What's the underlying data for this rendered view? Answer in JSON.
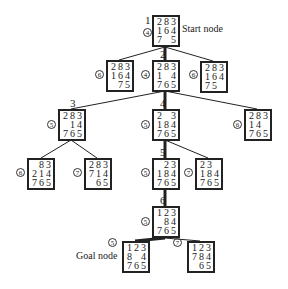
{
  "diagram": {
    "title": "",
    "labels": {
      "start": "Start node",
      "goal": "Goal node"
    },
    "nodes": [
      {
        "id": "n1",
        "order": "1",
        "cost": "4",
        "tiles": [
          "2",
          "8",
          "3",
          "1",
          "6",
          "4",
          "7",
          " ",
          "5"
        ],
        "x": 152,
        "y": 15,
        "cost_pos": [
          143,
          28
        ],
        "order_pos": [
          145,
          15
        ]
      },
      {
        "id": "n2a",
        "order": "",
        "cost": "6",
        "tiles": [
          "2",
          "8",
          "3",
          "1",
          "6",
          "4",
          " ",
          "7",
          "5"
        ],
        "x": 106,
        "y": 60,
        "cost_pos": [
          95,
          70
        ]
      },
      {
        "id": "n2",
        "order": "2",
        "cost": "4",
        "tiles": [
          "2",
          "8",
          "3",
          "1",
          " ",
          "4",
          "7",
          "6",
          "5"
        ],
        "x": 152,
        "y": 60,
        "cost_pos": [
          141,
          70
        ],
        "order_pos": [
          160,
          49
        ]
      },
      {
        "id": "n2c",
        "order": "",
        "cost": "6",
        "tiles": [
          "2",
          "8",
          "3",
          "1",
          "6",
          "4",
          "7",
          "5",
          " "
        ],
        "x": 200,
        "y": 61,
        "cost_pos": [
          189,
          70
        ]
      },
      {
        "id": "n3",
        "order": "3",
        "cost": "5",
        "tiles": [
          "2",
          "8",
          "3",
          " ",
          "1",
          "4",
          "7",
          "6",
          "5"
        ],
        "x": 58,
        "y": 109,
        "cost_pos": [
          47,
          120
        ],
        "order_pos": [
          70,
          98
        ]
      },
      {
        "id": "n4",
        "order": "4",
        "cost": "5",
        "tiles": [
          "2",
          " ",
          "3",
          "1",
          "8",
          "4",
          "7",
          "6",
          "5"
        ],
        "x": 152,
        "y": 109,
        "cost_pos": [
          141,
          120
        ],
        "order_pos": [
          160,
          98
        ]
      },
      {
        "id": "n3c",
        "order": "",
        "cost": "6",
        "tiles": [
          "2",
          "8",
          "3",
          "1",
          "4",
          " ",
          "7",
          "6",
          "5"
        ],
        "x": 244,
        "y": 109,
        "cost_pos": [
          233,
          120
        ]
      },
      {
        "id": "n3a1",
        "order": "",
        "cost": "6",
        "tiles": [
          " ",
          "8",
          "3",
          "2",
          "1",
          "4",
          "7",
          "6",
          "5"
        ],
        "x": 27,
        "y": 158,
        "cost_pos": [
          16,
          168
        ]
      },
      {
        "id": "n3a2",
        "order": "",
        "cost": "7",
        "tiles": [
          "2",
          "8",
          "3",
          "7",
          "1",
          "4",
          " ",
          "6",
          "5"
        ],
        "x": 84,
        "y": 158,
        "cost_pos": [
          73,
          168
        ]
      },
      {
        "id": "n5",
        "order": "5",
        "cost": "5",
        "tiles": [
          " ",
          "2",
          "3",
          "1",
          "8",
          "4",
          "7",
          "6",
          "5"
        ],
        "x": 152,
        "y": 158,
        "cost_pos": [
          141,
          168
        ],
        "order_pos": [
          160,
          147
        ]
      },
      {
        "id": "n5b",
        "order": "",
        "cost": "7",
        "tiles": [
          "2",
          "3",
          " ",
          "1",
          "8",
          "4",
          "7",
          "6",
          "5"
        ],
        "x": 195,
        "y": 158,
        "cost_pos": [
          184,
          168
        ]
      },
      {
        "id": "n6",
        "order": "6",
        "cost": "5",
        "tiles": [
          "1",
          "2",
          "3",
          " ",
          "8",
          "4",
          "7",
          "6",
          "5"
        ],
        "x": 152,
        "y": 206,
        "cost_pos": [
          141,
          217
        ],
        "order_pos": [
          160,
          195
        ]
      },
      {
        "id": "goal",
        "order": "",
        "cost": "5",
        "tiles": [
          "1",
          "2",
          "3",
          "8",
          " ",
          "4",
          "7",
          "6",
          "5"
        ],
        "x": 122,
        "y": 241,
        "cost_pos": [
          108,
          238
        ]
      },
      {
        "id": "n7b",
        "order": "",
        "cost": "7",
        "tiles": [
          "1",
          "2",
          "3",
          "7",
          "8",
          "4",
          " ",
          "6",
          "5"
        ],
        "x": 187,
        "y": 241,
        "cost_pos": [
          173,
          238
        ]
      }
    ],
    "edges": [
      {
        "from": [
          165,
          47
        ],
        "to": [
          119,
          60
        ],
        "bold": false
      },
      {
        "from": [
          165,
          47
        ],
        "to": [
          165,
          60
        ],
        "bold": true
      },
      {
        "from": [
          165,
          47
        ],
        "to": [
          213,
          61
        ],
        "bold": false
      },
      {
        "from": [
          165,
          91
        ],
        "to": [
          71,
          109
        ],
        "bold": false
      },
      {
        "from": [
          165,
          91
        ],
        "to": [
          165,
          109
        ],
        "bold": true
      },
      {
        "from": [
          165,
          91
        ],
        "to": [
          257,
          109
        ],
        "bold": false
      },
      {
        "from": [
          71,
          140
        ],
        "to": [
          41,
          158
        ],
        "bold": false
      },
      {
        "from": [
          71,
          140
        ],
        "to": [
          97,
          158
        ],
        "bold": false
      },
      {
        "from": [
          165,
          140
        ],
        "to": [
          165,
          158
        ],
        "bold": true
      },
      {
        "from": [
          165,
          140
        ],
        "to": [
          208,
          158
        ],
        "bold": false
      },
      {
        "from": [
          165,
          190
        ],
        "to": [
          165,
          206
        ],
        "bold": true
      },
      {
        "from": [
          165,
          238
        ],
        "to": [
          135,
          241
        ],
        "bold": true
      },
      {
        "from": [
          165,
          238
        ],
        "to": [
          200,
          241
        ],
        "bold": false
      }
    ]
  }
}
